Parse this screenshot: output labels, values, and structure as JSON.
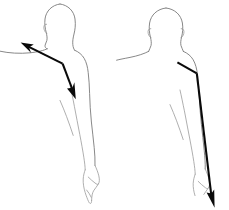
{
  "illustration": {
    "title": "Anatomical arm movement diagram",
    "background_color": "#ffffff",
    "outline_color": "#7a7a7a",
    "arrow_color": "#0a0a0a",
    "figures": [
      {
        "id": "left-figure",
        "label": "Front view figure with bidirectional shoulder arrow",
        "view": "front-left",
        "arrow": {
          "name": "bidirectional-shoulder-arrow",
          "style": "double-headed",
          "direction_primary": "up-left toward neck",
          "direction_secondary": "down-right toward elbow",
          "bend_point": "shoulder"
        }
      },
      {
        "id": "right-figure",
        "label": "Back view figure with downward arm arrow",
        "view": "back-right",
        "arrow": {
          "name": "downward-arm-arrow",
          "style": "single-headed",
          "direction_primary": "down-right toward hand",
          "direction_secondary": "none",
          "bend_point": "shoulder"
        }
      }
    ]
  }
}
